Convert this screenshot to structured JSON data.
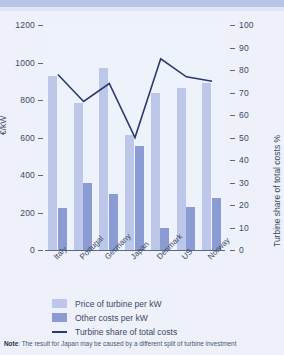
{
  "chart_data": {
    "type": "bar",
    "title": "",
    "subtitle": "",
    "categories": [
      "Italy",
      "Portugal",
      "Germany",
      "Japan",
      "Denmark",
      "US",
      "Norway"
    ],
    "series": [
      {
        "name": "Price of turbine per kW",
        "type": "bar",
        "axis": "left",
        "color": "#bcc7e9",
        "values": [
          930,
          785,
          970,
          615,
          840,
          865,
          890
        ]
      },
      {
        "name": "Other costs per kW",
        "type": "bar",
        "axis": "left",
        "color": "#8b9cd4",
        "values": [
          225,
          355,
          300,
          555,
          120,
          230,
          280
        ]
      },
      {
        "name": "Turbine share of total costs",
        "type": "line",
        "axis": "right",
        "color": "#2b3a6b",
        "values": [
          78,
          66,
          74,
          50,
          85,
          77,
          75
        ]
      }
    ],
    "xlabel": "",
    "ylabel": "€/kW",
    "ylabel_right": "Turbine share of total costs %",
    "ylim": [
      0,
      1200
    ],
    "ylim_right": [
      0,
      100
    ],
    "yticks": [
      0,
      200,
      400,
      600,
      800,
      1000,
      1200
    ],
    "yticks_right": [
      0,
      10,
      20,
      30,
      40,
      50,
      60,
      70,
      80,
      90,
      100
    ],
    "grid": false,
    "legend_position": "bottom-left"
  },
  "axis": {
    "left_title": "€/kW",
    "right_title": "Turbine share of total costs %",
    "left_ticks": [
      "1200",
      "1000",
      "800",
      "600",
      "400",
      "200",
      "0"
    ],
    "right_ticks": [
      "100",
      "90",
      "80",
      "70",
      "60",
      "50",
      "40",
      "30",
      "20",
      "10",
      "0"
    ]
  },
  "legend": {
    "items": [
      {
        "label": "Price of turbine per kW",
        "marker": "swatch-light",
        "color": "#bcc7e9"
      },
      {
        "label": "Other costs per kW",
        "marker": "swatch-dark",
        "color": "#8b9cd4"
      },
      {
        "label": "Turbine share of total costs",
        "marker": "line",
        "color": "#2b3a6b"
      }
    ]
  },
  "note": {
    "prefix": "Note",
    "separator": ": ",
    "text": "The result for Japan may be caused by a different split of turbine investment"
  }
}
